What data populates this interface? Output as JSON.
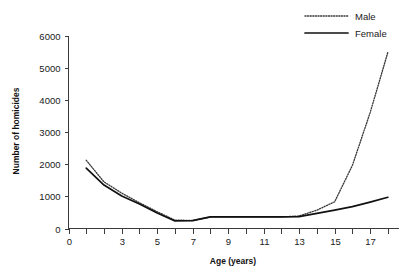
{
  "chart_data": {
    "type": "line",
    "title": "",
    "xlabel": "Age (years)",
    "ylabel": "Number of homicides",
    "xlim": [
      0,
      18.6
    ],
    "ylim": [
      0,
      6000
    ],
    "grid": false,
    "legend_position": "top-right",
    "x": [
      1,
      2,
      3,
      4,
      5,
      6,
      7,
      8,
      9,
      10,
      11,
      12,
      13,
      14,
      15,
      16,
      17,
      18
    ],
    "series": [
      {
        "name": "Male",
        "style": "dotted",
        "color": "#3a3a3a",
        "values": [
          2120,
          1450,
          1100,
          800,
          520,
          260,
          250,
          360,
          360,
          360,
          360,
          360,
          390,
          570,
          830,
          1960,
          3600,
          5480
        ]
      },
      {
        "name": "Female",
        "style": "solid",
        "color": "#111111",
        "values": [
          1880,
          1350,
          1010,
          760,
          480,
          235,
          245,
          360,
          360,
          360,
          360,
          360,
          370,
          470,
          570,
          680,
          820,
          970
        ]
      }
    ],
    "x_ticks": [
      0,
      1,
      2,
      3,
      4,
      5,
      6,
      7,
      8,
      9,
      10,
      11,
      12,
      13,
      14,
      15,
      16,
      17,
      18
    ],
    "x_tick_labels": [
      "0",
      "",
      "",
      "3",
      "",
      "5",
      "",
      "7",
      "",
      "9",
      "",
      "11",
      "",
      "13",
      "",
      "15",
      "",
      "17",
      ""
    ],
    "y_ticks": [
      0,
      1000,
      2000,
      3000,
      4000,
      5000,
      6000
    ],
    "y_tick_labels": [
      "0",
      "1000",
      "2000",
      "3000",
      "4000",
      "5000",
      "6000"
    ]
  },
  "legend": {
    "entries": [
      {
        "label": "Male"
      },
      {
        "label": "Female"
      }
    ]
  }
}
